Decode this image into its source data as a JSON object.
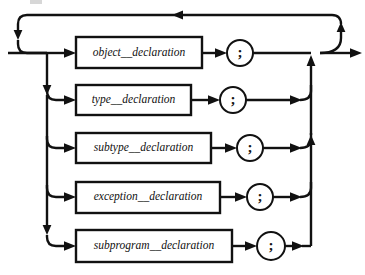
{
  "diagram": {
    "kind": "railroad-syntax-diagram",
    "canvas": {
      "width": 365,
      "height": 275,
      "background": "#ffffff"
    },
    "colors": {
      "line": "#111111",
      "box_fill": "#ffffff",
      "text": "#111111",
      "smudge": "#c9c9c9"
    },
    "geometry": {
      "entry_x": 8,
      "loop_back_y": 15,
      "loop_left_x": 18,
      "left_bus_x": 47,
      "box_left_x": 76,
      "right_bus_x": 311,
      "loop_right_x": 341,
      "exit_x": 362,
      "main_line_y": 53
    },
    "loop_back": {
      "name": "repeat-loop",
      "arrow_direction": "left",
      "arrow_x": 178,
      "y": 15
    },
    "rows": [
      {
        "id": "object-declaration",
        "label": "object__declaration",
        "terminal": ";",
        "box": {
          "x": 76,
          "y": 37,
          "w": 126,
          "h": 31
        },
        "center_y": 53,
        "circle_cx": 240,
        "circle_r": 13,
        "line_end_x": 311,
        "merge": "straight"
      },
      {
        "id": "type-declaration",
        "label": "type__declaration",
        "terminal": ";",
        "box": {
          "x": 76,
          "y": 85,
          "w": 115,
          "h": 30
        },
        "center_y": 100,
        "circle_cx": 233,
        "circle_r": 13,
        "line_end_x": 300,
        "merge": "curve-up"
      },
      {
        "id": "subtype-declaration",
        "label": "subtype__declaration",
        "terminal": ";",
        "box": {
          "x": 76,
          "y": 133,
          "w": 135,
          "h": 30
        },
        "center_y": 148,
        "circle_cx": 250,
        "circle_r": 13,
        "line_end_x": 300,
        "merge": "curve-up"
      },
      {
        "id": "exception-declaration",
        "label": "exception__declaration",
        "terminal": ";",
        "box": {
          "x": 76,
          "y": 182,
          "w": 144,
          "h": 31
        },
        "center_y": 197,
        "circle_cx": 260,
        "circle_r": 13,
        "line_end_x": 300,
        "merge": "curve-up"
      },
      {
        "id": "subprogram-declaration",
        "label": "subprogram__declaration",
        "terminal": ";",
        "box": {
          "x": 76,
          "y": 230,
          "w": 156,
          "h": 32
        },
        "center_y": 246,
        "circle_cx": 271,
        "circle_r": 14,
        "line_end_x": 300,
        "merge": "curve-up"
      }
    ],
    "artifact": {
      "name": "scan-smudge",
      "x": 30,
      "y": 0,
      "w": 12,
      "h": 4
    }
  }
}
